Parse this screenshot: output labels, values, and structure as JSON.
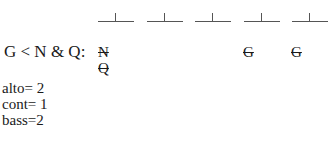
{
  "slots": {
    "count": 5,
    "positions_x": [
      98,
      147,
      195,
      244,
      292
    ]
  },
  "rule": {
    "label": "G < N & Q:"
  },
  "eliminated": [
    {
      "slot": 1,
      "letters": [
        "N",
        "Q"
      ]
    },
    {
      "slot": 4,
      "letters": [
        "G"
      ]
    },
    {
      "slot": 5,
      "letters": [
        "G"
      ]
    }
  ],
  "voices": {
    "alto": "alto= 2",
    "cont": "cont= 1",
    "bass": "bass=2"
  }
}
